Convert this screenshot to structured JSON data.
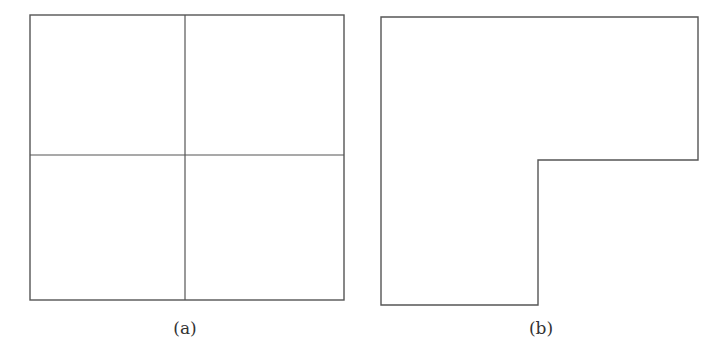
{
  "figures": [
    {
      "id": "a",
      "caption": "(a)",
      "shape": "square divided into four equal quadrants",
      "outline": {
        "x": 30,
        "y": 15,
        "width": 314,
        "height": 285
      },
      "dividers": {
        "vertical_x": 185,
        "horizontal_y": 155
      }
    },
    {
      "id": "b",
      "caption": "(b)",
      "shape": "L-shaped region (square with bottom-right quadrant removed)",
      "points": "381,17 698,17 698,160 538,160 538,305 381,305"
    }
  ],
  "colors": {
    "line": "#555555",
    "background": "#ffffff",
    "text": "#333333"
  }
}
